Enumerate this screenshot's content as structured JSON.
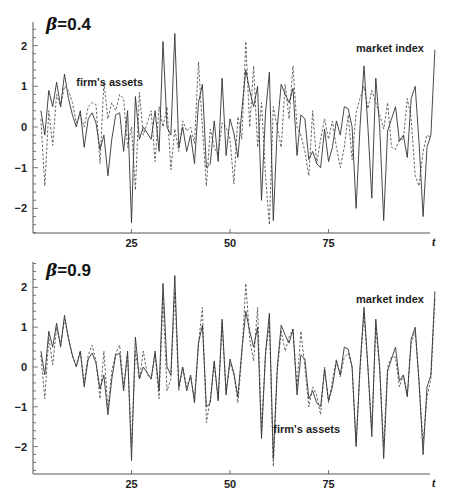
{
  "chart_data": [
    {
      "type": "line",
      "title": "β=0.4",
      "title_prefix": "β",
      "title_value": "=0.4",
      "xlabel": "t",
      "ylabel": "",
      "xlim": [
        0,
        100
      ],
      "ylim": [
        -2.6,
        2.6
      ],
      "xticks": [
        25,
        50,
        75
      ],
      "xtick_labels": [
        "25",
        "50",
        "75"
      ],
      "yticks": [
        2,
        1,
        0,
        -1,
        -2
      ],
      "ytick_labels": [
        "2",
        "1",
        "0",
        "−1",
        "−2"
      ],
      "grid": false,
      "annotations": [
        {
          "text": "firm's assets",
          "x": 11,
          "y": 1.0
        },
        {
          "text": "market index",
          "x": 82,
          "y": 1.85
        }
      ],
      "x_start": 2,
      "series": [
        {
          "name": "market index",
          "style": "solid",
          "values": [
            0.4,
            -0.2,
            0.9,
            0.5,
            1.1,
            0.5,
            1.3,
            0.7,
            0.3,
            0.0,
            0.4,
            -0.5,
            0.2,
            0.35,
            0.1,
            -0.55,
            -0.2,
            -1.2,
            -0.3,
            0.3,
            0.35,
            -0.6,
            0.4,
            -2.35,
            0.75,
            -0.3,
            0.0,
            -0.15,
            -0.3,
            0.4,
            -0.6,
            2.1,
            0.0,
            -0.2,
            2.3,
            -0.5,
            0.0,
            -0.6,
            -0.2,
            -0.9,
            0.6,
            1.05,
            -1.0,
            -0.9,
            0.15,
            -0.85,
            1.2,
            -0.7,
            0.2,
            -0.15,
            -0.75,
            0.4,
            1.4,
            0.9,
            0.5,
            1.0,
            -1.8,
            0.35,
            1.35,
            -2.3,
            0.0,
            1.05,
            0.8,
            0.6,
            0.95,
            -0.7,
            0.3,
            0.2,
            -0.8,
            -0.6,
            -0.9,
            -1.0,
            -0.05,
            -0.85,
            -0.5,
            0.15,
            -0.2,
            0.5,
            0.45,
            0.0,
            -2.0,
            0.0,
            1.5,
            0.0,
            -1.75,
            1.2,
            0.0,
            -2.3,
            -0.1,
            0.2,
            0.5,
            -0.35,
            -0.2,
            -0.75,
            0.7,
            1.0,
            -0.4,
            -2.2,
            -0.5,
            -0.2,
            1.9
          ]
        },
        {
          "name": "firm's assets",
          "style": "dashed",
          "values": [
            0.2,
            -1.45,
            0.4,
            -0.45,
            0.8,
            0.5,
            1.0,
            0.9,
            0.6,
            0.1,
            0.3,
            0.0,
            0.5,
            0.6,
            0.55,
            -0.9,
            1.1,
            0.2,
            0.6,
            0.4,
            0.8,
            0.7,
            -0.5,
            0.0,
            -1.55,
            0.85,
            -0.2,
            0.1,
            0.4,
            -0.85,
            0.5,
            0.0,
            0.5,
            -1.05,
            -0.05,
            -0.6,
            0.15,
            -0.1,
            0.0,
            -0.4,
            1.6,
            0.0,
            -1.45,
            -0.05,
            -0.5,
            -0.7,
            0.1,
            0.0,
            -0.3,
            -1.4,
            0.25,
            -0.3,
            2.1,
            0.0,
            1.5,
            -0.5,
            0.6,
            -1.2,
            -2.4,
            0.5,
            0.0,
            -0.5,
            1.05,
            0.2,
            1.5,
            0.0,
            -0.2,
            -0.6,
            -1.2,
            0.4,
            -0.9,
            -0.3,
            0.2,
            -0.3,
            0.15,
            -0.5,
            -1.0,
            -0.5,
            0.3,
            -0.8,
            0.35,
            0.7,
            1.0,
            0.45,
            0.9,
            0.6,
            0.3,
            -0.05,
            0.6,
            -0.5,
            -0.55,
            -0.3,
            -0.3,
            0.7,
            0.2,
            -1.2,
            -1.45,
            -0.6,
            -0.2,
            -0.25
          ]
        }
      ]
    },
    {
      "type": "line",
      "title": "β=0.9",
      "title_prefix": "β",
      "title_value": "=0.9",
      "xlabel": "t",
      "ylabel": "",
      "xlim": [
        0,
        100
      ],
      "ylim": [
        -2.6,
        2.6
      ],
      "xticks": [
        25,
        50,
        75
      ],
      "xtick_labels": [
        "25",
        "50",
        "75"
      ],
      "yticks": [
        2,
        1,
        0,
        -1,
        -2
      ],
      "ytick_labels": [
        "2",
        "1",
        "0",
        "−1",
        "−2"
      ],
      "grid": false,
      "annotations": [
        {
          "text": "market index",
          "x": 82,
          "y": 1.6
        },
        {
          "text": "firm's assets",
          "x": 61,
          "y": -1.65
        }
      ],
      "x_start": 2,
      "series": [
        {
          "name": "market index",
          "style": "solid",
          "values": [
            0.4,
            -0.2,
            0.9,
            0.5,
            1.1,
            0.5,
            1.3,
            0.7,
            0.3,
            0.0,
            0.4,
            -0.5,
            0.2,
            0.35,
            0.1,
            -0.55,
            -0.2,
            -1.2,
            -0.3,
            0.3,
            0.35,
            -0.6,
            0.4,
            -2.35,
            0.75,
            -0.3,
            0.0,
            -0.15,
            -0.3,
            0.4,
            -0.6,
            2.1,
            0.0,
            -0.2,
            2.3,
            -0.5,
            0.0,
            -0.6,
            -0.2,
            -0.9,
            0.6,
            1.05,
            -1.0,
            -0.9,
            0.15,
            -0.85,
            1.2,
            -0.7,
            0.2,
            -0.15,
            -0.75,
            0.4,
            1.4,
            0.9,
            0.5,
            1.0,
            -1.8,
            0.35,
            1.35,
            -2.3,
            0.0,
            1.05,
            0.8,
            0.6,
            0.95,
            -0.7,
            0.3,
            0.2,
            -0.8,
            -0.6,
            -0.9,
            -1.0,
            -0.05,
            -0.85,
            -0.5,
            0.15,
            -0.2,
            0.5,
            0.45,
            0.0,
            -2.0,
            0.0,
            1.5,
            0.0,
            -1.75,
            1.2,
            0.0,
            -2.3,
            -0.1,
            0.2,
            0.5,
            -0.35,
            -0.2,
            -0.75,
            0.7,
            1.0,
            -0.4,
            -2.2,
            -0.5,
            -0.2,
            1.9
          ]
        },
        {
          "name": "firm's assets",
          "style": "dashed",
          "values": [
            0.3,
            -0.8,
            0.75,
            0.05,
            1.0,
            0.55,
            1.2,
            0.75,
            0.25,
            0.05,
            0.4,
            -0.4,
            0.3,
            0.55,
            0.15,
            -0.8,
            0.4,
            -1.05,
            -0.1,
            0.35,
            0.55,
            -0.5,
            0.3,
            -2.0,
            0.4,
            -0.3,
            0.4,
            -0.2,
            -0.3,
            0.3,
            -0.8,
            1.75,
            -0.6,
            -0.3,
            1.9,
            -0.6,
            0.0,
            -0.5,
            -0.25,
            -0.8,
            0.6,
            1.5,
            -1.4,
            -0.8,
            0.1,
            -0.8,
            1.1,
            -0.6,
            0.1,
            -0.2,
            -0.9,
            0.3,
            2.1,
            0.7,
            0.15,
            1.5,
            -1.6,
            0.3,
            1.1,
            -2.5,
            -0.1,
            0.9,
            0.4,
            0.75,
            0.95,
            -0.5,
            0.9,
            0.0,
            -1.0,
            -0.5,
            -0.7,
            -1.2,
            0.0,
            -0.9,
            -0.35,
            0.2,
            -0.25,
            0.25,
            0.35,
            0.0,
            -1.9,
            -0.1,
            1.35,
            0.0,
            -1.55,
            1.0,
            -0.05,
            -2.0,
            0.0,
            0.25,
            0.25,
            -0.5,
            -0.2,
            -0.7,
            0.6,
            0.9,
            -0.4,
            -1.9,
            -0.75,
            -0.3,
            1.7
          ]
        }
      ]
    }
  ]
}
